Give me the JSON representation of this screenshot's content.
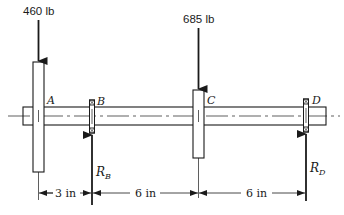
{
  "diagram": {
    "loads": [
      {
        "id": "A",
        "label": "460 lb",
        "direction": "down"
      },
      {
        "id": "C",
        "label": "685 lb",
        "direction": "down"
      }
    ],
    "points": {
      "A": "A",
      "B": "B",
      "C": "C",
      "D": "D"
    },
    "reactions": [
      {
        "id": "RB",
        "symbol": "R",
        "subscript": "B",
        "direction": "up"
      },
      {
        "id": "RD",
        "symbol": "R",
        "subscript": "D",
        "direction": "up"
      }
    ],
    "dimensions": [
      {
        "from": "A",
        "to": "B",
        "label": "3 in"
      },
      {
        "from": "B",
        "to": "C",
        "label": "6 in"
      },
      {
        "from": "C",
        "to": "D",
        "label": "6 in"
      }
    ],
    "colors": {
      "line": "#1a1a1a",
      "background": "#ffffff"
    }
  }
}
